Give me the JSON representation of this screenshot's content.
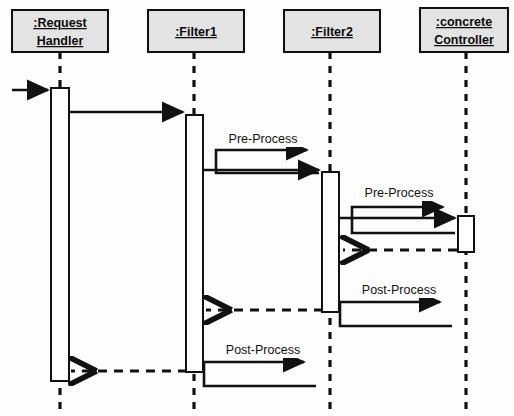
{
  "diagram": {
    "type": "uml-sequence-diagram",
    "background_color": "#fdfdfd",
    "line_color": "#111111",
    "header_fill_color": "#e3e3e3",
    "activation_fill_color": "#ffffff"
  },
  "lifelines": [
    {
      "id": "request-handler",
      "name_lines": [
        "ient",
        "ndler"
      ],
      "label_line1": ":Request",
      "label_line2": "Handler",
      "x": 60,
      "box": {
        "x": 12,
        "y": 10,
        "width": 96,
        "height": 42
      },
      "activation": {
        "x": 51,
        "y": 88,
        "width": 18,
        "height": 293
      }
    },
    {
      "id": "filter1",
      "label_line1": ":Filter1",
      "label_line2": "",
      "x": 194,
      "box": {
        "x": 148,
        "y": 10,
        "width": 96,
        "height": 42
      },
      "activation": {
        "x": 186,
        "y": 115,
        "width": 17,
        "height": 257
      }
    },
    {
      "id": "filter2",
      "label_line1": ":Filter2",
      "label_line2": "",
      "x": 330,
      "box": {
        "x": 284,
        "y": 10,
        "width": 96,
        "height": 42
      },
      "activation": {
        "x": 322,
        "y": 172,
        "width": 17,
        "height": 140
      }
    },
    {
      "id": "concrete-controller",
      "label_line1": ":concrete",
      "label_line2": "Controller",
      "x": 466,
      "box": {
        "x": 420,
        "y": 8,
        "width": 88,
        "height": 44
      },
      "activation": {
        "x": 458,
        "y": 216,
        "width": 16,
        "height": 36
      }
    }
  ],
  "messages": [
    {
      "id": "incoming-request",
      "label": "",
      "kind": "solid",
      "from_x": 12,
      "to_x": 49,
      "y": 90,
      "direction": "right"
    },
    {
      "id": "handler-to-filter1",
      "label": "",
      "kind": "solid",
      "from_x": 69,
      "to_x": 184,
      "y": 112,
      "direction": "right"
    },
    {
      "id": "filter1-pre-process",
      "label": "Pre-Process",
      "kind": "self-solid",
      "lifeline": "filter1",
      "label_x": 258,
      "label_y": 138,
      "out_y": 127,
      "back_y": 150,
      "left_x": 204,
      "right_x": 307
    },
    {
      "id": "filter1-to-filter2",
      "label": "",
      "kind": "solid",
      "from_x": 204,
      "to_x": 320,
      "y": 170,
      "direction": "right"
    },
    {
      "id": "filter2-pre-process",
      "label": "Pre-Process",
      "kind": "self-solid",
      "lifeline": "filter2",
      "label_x": 394,
      "label_y": 192,
      "out_y": 181,
      "back_y": 207,
      "left_x": 340,
      "right_x": 443
    },
    {
      "id": "filter2-to-controller",
      "label": "",
      "kind": "solid",
      "from_x": 340,
      "to_x": 456,
      "y": 218,
      "direction": "right"
    },
    {
      "id": "controller-return",
      "label": "",
      "kind": "dashed",
      "from_x": 456,
      "to_x": 342,
      "y": 250,
      "direction": "left"
    },
    {
      "id": "filter2-post-process",
      "label": "Post-Process",
      "kind": "self-solid",
      "lifeline": "filter2",
      "label_x": 396,
      "label_y": 289,
      "out_y": 278,
      "back_y": 302,
      "left_x": 340,
      "right_x": 452
    },
    {
      "id": "filter2-return-to-filter1",
      "label": "",
      "kind": "dashed",
      "from_x": 322,
      "to_x": 205,
      "y": 310,
      "direction": "left"
    },
    {
      "id": "filter1-post-process",
      "label": "Post-Process",
      "kind": "self-solid",
      "lifeline": "filter1",
      "label_x": 260,
      "label_y": 349,
      "out_y": 338,
      "back_y": 362,
      "left_x": 204,
      "right_x": 316
    },
    {
      "id": "filter1-return-to-handler",
      "label": "",
      "kind": "dashed",
      "from_x": 186,
      "to_x": 70,
      "y": 371,
      "direction": "left"
    }
  ],
  "labels": {
    "pre_process": "Pre-Process",
    "post_process": "Post-Process"
  }
}
